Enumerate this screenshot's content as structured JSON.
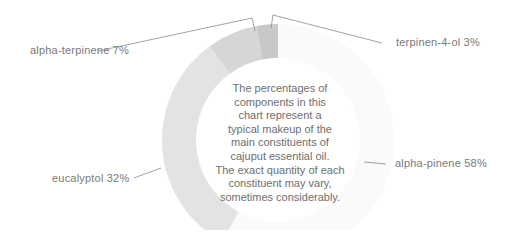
{
  "chart_data": {
    "type": "pie",
    "subtype": "donut",
    "title": "",
    "categories": [
      "alpha-pinene",
      "eucalyptol",
      "alpha-terpinene",
      "terpinen-4-ol"
    ],
    "values": [
      58,
      32,
      7,
      3
    ],
    "unit": "%",
    "colors": [
      "#fafafa",
      "#e3e3e3",
      "#d6d6d6",
      "#c8c8c8"
    ],
    "labels": [
      "alpha-pinene 58%",
      "eucalyptol 32%",
      "alpha-terpinene 7%",
      "terpinen-4-ol 3%"
    ],
    "center_note": "The percentages of components in this chart represent a typical makeup of the main constituents of cajuput essential oil. The exact quantity of each constituent may vary, sometimes considerably.",
    "start_angle_deg": 0,
    "direction": "clockwise",
    "legend": "none (leader-line labels)"
  },
  "labels": {
    "alpha_pinene": "alpha-pinene 58%",
    "eucalyptol": "eucalyptol 32%",
    "alpha_terpinene": "alpha-terpinene 7%",
    "terpinen_4_ol": "terpinen-4-ol 3%"
  },
  "center_note_lines": [
    "The percentages of",
    "components in this",
    "chart represent a",
    "typical makeup of the",
    "main constituents of",
    "cajuput essential oil.",
    "The exact quantity of each",
    "constituent may vary,",
    "sometimes considerably."
  ]
}
